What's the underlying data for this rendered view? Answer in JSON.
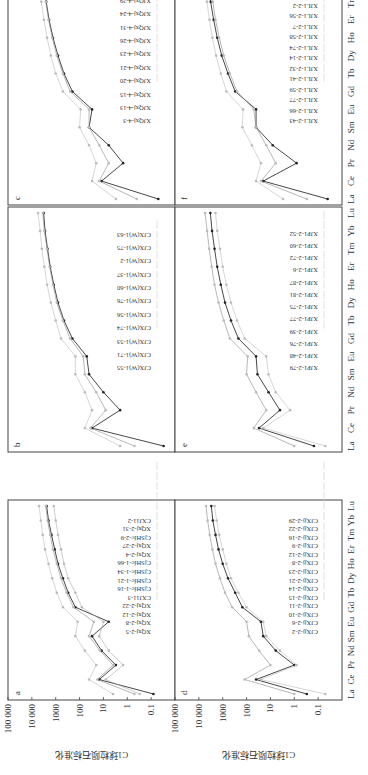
{
  "figure": {
    "ylabel": "C1球粒陨石标准化",
    "yticks": [
      "100 000",
      "10 000",
      "1000",
      "100",
      "10",
      "1",
      "0.1"
    ],
    "elements": [
      "La",
      "Ce",
      "Pr",
      "Nd",
      "Sm",
      "Eu",
      "Gd",
      "Tb",
      "Dy",
      "Ho",
      "Er",
      "Tm",
      "Yb",
      "Lu"
    ]
  },
  "chart_data": [
    {
      "panel": "a",
      "type": "line",
      "title": "a",
      "xlabel": "",
      "ylabel": "C1球粒陨石标准化",
      "yscale": "log",
      "ylim": [
        0.01,
        100000
      ],
      "categories": [
        "La",
        "Ce",
        "Pr",
        "Nd",
        "Sm",
        "Eu",
        "Gd",
        "Tb",
        "Dy",
        "Ho",
        "Er",
        "Tm",
        "Yb",
        "Lu"
      ],
      "legend": [
        "XQxj-2-5",
        "XQxj-2-8",
        "XQxj-2-12",
        "XQxj-2-22",
        "CXJ11-3",
        "CjSHfc-1-16",
        "CjSHfc-1-21",
        "CjSHfc-1-34",
        "CjSHfc-1-66",
        "XQxj-2-4",
        "XQxj-2-27",
        "CjSHfc-2-9",
        "XQxj-2-31",
        "CXJ11-2"
      ],
      "series": [
        {
          "name": "CXJ11-2",
          "values": [
            0.08,
            15,
            3,
            12,
            30,
            6,
            150,
            300,
            500,
            800,
            1100,
            1500,
            2000,
            2400
          ]
        },
        {
          "name": "typical",
          "values": [
            0.5,
            18,
            4,
            14,
            40,
            25,
            180,
            350,
            600,
            900,
            1300,
            1700,
            2200,
            2600
          ]
        },
        {
          "name": "high",
          "values": [
            4,
            40,
            20,
            60,
            150,
            120,
            500,
            900,
            1400,
            2000,
            2800,
            3500,
            4200,
            5000
          ]
        },
        {
          "name": "low",
          "values": [
            0.3,
            8,
            1.5,
            6,
            15,
            10,
            80,
            150,
            300,
            450,
            600,
            800,
            1000,
            1200
          ]
        }
      ]
    },
    {
      "panel": "b",
      "type": "line",
      "title": "b",
      "xlabel": "",
      "ylabel": "",
      "yscale": "log",
      "ylim": [
        0.01,
        100000
      ],
      "categories": [
        "La",
        "Ce",
        "Pr",
        "Nd",
        "Sm",
        "Eu",
        "Gd",
        "Tb",
        "Dy",
        "Ho",
        "Er",
        "Tm",
        "Yb",
        "Lu"
      ],
      "legend": [
        "CJX(W)1-55",
        "CJX(W)1-71",
        "CJX(W)1-53",
        "CJX(W)1-74",
        "CJX(W)1-56",
        "CJX(W)1-76",
        "CJX(W)1-60",
        "CJX(W)1-37",
        "CJX(W)1-2",
        "CJX(W)1-75",
        "CJX(W)1-63"
      ],
      "series": [
        {
          "name": "CJX(W)1-55",
          "values": [
            0.03,
            30,
            2,
            10,
            40,
            50,
            200,
            450,
            800,
            1200,
            1700,
            2200,
            2800,
            3200
          ]
        },
        {
          "name": "typical",
          "values": [
            0.5,
            35,
            8,
            20,
            60,
            70,
            250,
            500,
            900,
            1300,
            1800,
            2300,
            3000,
            3500
          ]
        },
        {
          "name": "high",
          "values": [
            2,
            60,
            30,
            60,
            150,
            150,
            600,
            1000,
            1600,
            2300,
            3000,
            3800,
            4500,
            5500
          ]
        }
      ]
    },
    {
      "panel": "c",
      "type": "line",
      "title": "c",
      "xlabel": "",
      "ylabel": "",
      "yscale": "log",
      "ylim": [
        0.01,
        100000
      ],
      "categories": [
        "La",
        "Ce",
        "Pr",
        "Nd",
        "Sm",
        "Eu",
        "Gd",
        "Tb",
        "Dy",
        "Ho",
        "Er",
        "Tm",
        "Yb",
        "Lu"
      ],
      "legend": [
        "XJQxj-4-3",
        "XJQxj-4-13",
        "XJQxj-4-15",
        "XJQxj-4-20",
        "XJQxj-4-21",
        "XJQxj-4-23",
        "XJQxj-4-26",
        "XJQxj-4-31",
        "XJQxj-4-24",
        "XJQxj-4-29",
        "XJQxj-4-7"
      ],
      "series": [
        {
          "name": "XJQxj-4-21",
          "values": [
            0.05,
            12,
            1.5,
            6,
            40,
            30,
            200,
            450,
            800,
            1300,
            1900,
            2500,
            3200,
            3800
          ]
        },
        {
          "name": "typical",
          "values": [
            0.4,
            15,
            6,
            15,
            40,
            40,
            250,
            500,
            900,
            1400,
            2000,
            2600,
            3300,
            4000
          ]
        },
        {
          "name": "high",
          "values": [
            3,
            30,
            20,
            40,
            100,
            90,
            500,
            1000,
            1600,
            2300,
            3100,
            4000,
            5000,
            6000
          ]
        }
      ]
    },
    {
      "panel": "d",
      "type": "line",
      "title": "d",
      "xlabel": "",
      "ylabel": "C1球粒陨石标准化",
      "yscale": "log",
      "ylim": [
        0.01,
        100000
      ],
      "categories": [
        "La",
        "Ce",
        "Pr",
        "Nd",
        "Sm",
        "Eu",
        "Gd",
        "Tb",
        "Dy",
        "Ho",
        "Er",
        "Tm",
        "Yb",
        "Lu"
      ],
      "legend": [
        "CJXjj-2-2",
        "CJXjj-2-6",
        "CJXjj-2-10",
        "CJXjj-2-11",
        "CJXjj-2-15",
        "CJXjj-2-14",
        "CJXjj-2-21",
        "CJXjj-2-23",
        "CJXjj-2-8",
        "CJXjj-2-12",
        "CJXjj-2-9",
        "CJXjj-2-16",
        "CJXjj-2-22",
        "CJXjj-2-29"
      ],
      "series": [
        {
          "name": "typical",
          "values": [
            0.3,
            40,
            1,
            6,
            20,
            25,
            150,
            300,
            600,
            1000,
            1500,
            2000,
            2600,
            3000
          ]
        },
        {
          "name": "high",
          "values": [
            1,
            120,
            10,
            30,
            80,
            100,
            400,
            800,
            1300,
            2000,
            2700,
            3500,
            4300,
            5000
          ]
        },
        {
          "name": "low",
          "values": [
            0.05,
            25,
            0.8,
            4,
            15,
            20,
            100,
            220,
            450,
            700,
            1000,
            1400,
            1800,
            2200
          ]
        }
      ]
    },
    {
      "panel": "e",
      "type": "line",
      "title": "e",
      "xlabel": "",
      "ylabel": "",
      "yscale": "log",
      "ylim": [
        0.01,
        100000
      ],
      "categories": [
        "La",
        "Ce",
        "Pr",
        "Nd",
        "Sm",
        "Eu",
        "Gd",
        "Tb",
        "Dy",
        "Ho",
        "Er",
        "Tm",
        "Yb",
        "Lu"
      ],
      "legend": [
        "XJP1-2-79",
        "XJP1-2-48",
        "XJP1-2-76",
        "XJP1-2-39",
        "XJP1-2-77",
        "XJP1-2-75",
        "XJP1-2-81",
        "XJP1-2-87",
        "XJP1-2-6",
        "XJP1-2-72",
        "XJP1-2-60",
        "XJP1-2-52"
      ],
      "series": [
        {
          "name": "typical",
          "values": [
            0.15,
            30,
            4,
            12,
            35,
            40,
            220,
            450,
            800,
            1200,
            1700,
            2200,
            2800,
            3300
          ]
        },
        {
          "name": "high",
          "values": [
            1,
            50,
            15,
            40,
            100,
            90,
            500,
            900,
            1500,
            2200,
            2900,
            3700,
            4500,
            5500
          ]
        },
        {
          "name": "low",
          "values": [
            0.05,
            20,
            1.5,
            6,
            12,
            15,
            120,
            250,
            450,
            700,
            1000,
            1300,
            1700,
            2000
          ]
        }
      ]
    },
    {
      "panel": "f",
      "type": "line",
      "title": "f",
      "xlabel": "",
      "ylabel": "",
      "yscale": "log",
      "ylim": [
        0.01,
        100000
      ],
      "categories": [
        "La",
        "Ce",
        "Pr",
        "Nd",
        "Sm",
        "Eu",
        "Gd",
        "Tb",
        "Dy",
        "Ho",
        "Er",
        "Tm",
        "Yb",
        "Lu"
      ],
      "legend": [
        "XJL1-2-43",
        "XJL1-2-66",
        "XJL1-2-77",
        "XJL1-2-59",
        "XJL1-2-41",
        "XJL1-2-32",
        "XJL1-2-14",
        "XJL1-2-74",
        "XJL1-2-58",
        "XJL1-2-7",
        "XJL1-2-56",
        "XJL1-2-2",
        "XJL1-2-1",
        "XJL1-2-25"
      ],
      "series": [
        {
          "name": "XJL1-2-43",
          "values": [
            0.04,
            20,
            0.8,
            8,
            40,
            40,
            300,
            600,
            1100,
            1700,
            2400,
            3200,
            4000,
            5000
          ]
        },
        {
          "name": "typical",
          "values": [
            0.3,
            25,
            6,
            15,
            40,
            50,
            250,
            500,
            900,
            1400,
            2000,
            2600,
            3300,
            4000
          ]
        },
        {
          "name": "high",
          "values": [
            3,
            40,
            25,
            60,
            150,
            140,
            700,
            1200,
            1900,
            2700,
            3600,
            4600,
            5600,
            6800
          ]
        }
      ]
    }
  ]
}
